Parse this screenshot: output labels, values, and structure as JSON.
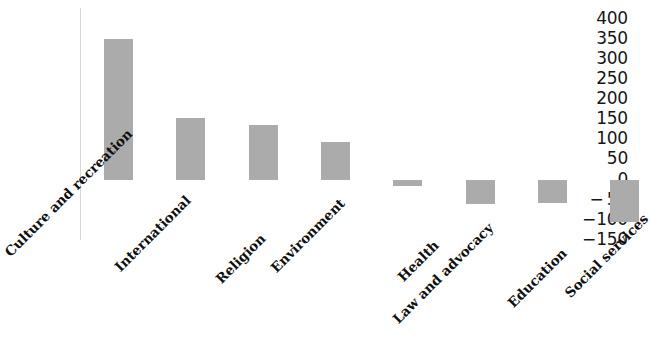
{
  "chart_data": {
    "type": "bar",
    "title": "",
    "subtitle": "",
    "xlabel": "",
    "ylabel": "",
    "categories": [
      "Culture and recreation",
      "International",
      "Religion",
      "Environment",
      "Health",
      "Law and advocacy",
      "Education",
      "Social services"
    ],
    "values": [
      352,
      155,
      138,
      95,
      -15,
      -60,
      -57,
      -105
    ],
    "series": [
      {
        "name": "",
        "values": [
          352,
          155,
          138,
          95,
          -15,
          -60,
          -57,
          -105
        ]
      }
    ],
    "ylim": [
      -150,
      400
    ],
    "yticks": [
      400,
      350,
      300,
      250,
      200,
      150,
      100,
      50,
      0,
      -50,
      -100,
      -150
    ],
    "ytick_labels": [
      "400",
      "350",
      "300",
      "250",
      "200",
      "150",
      "100",
      "50",
      "0",
      "− 50",
      "−100",
      "−150"
    ],
    "grid": false,
    "legend": null,
    "legend_position": "none",
    "bar_color": "#ababab",
    "axis_color": "#d8d8d8",
    "background_color": "#ffffff",
    "tick_label_rotation": -45,
    "annotations": []
  }
}
